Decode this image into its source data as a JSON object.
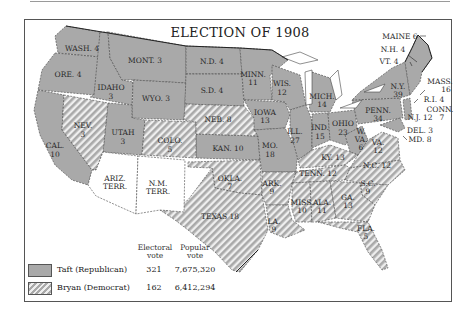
{
  "title": "ELECTION OF 1908",
  "colors": {
    "republican": "#a9a9a9",
    "democrat_hatch_dark": "#a9a9a9",
    "democrat_hatch_light": "#eeeeee",
    "territory": "#ffffff",
    "border": "#444444"
  },
  "legend": {
    "col_electoral": "Electoral",
    "col_electoral_2": "vote",
    "col_popular": "Popular",
    "col_popular_2": "vote",
    "rows": [
      {
        "name": "Taft (Republican)",
        "electoral": "321",
        "popular": "7,675,320",
        "pattern": "solid-gray"
      },
      {
        "name": "Bryan (Democrat)",
        "electoral": "162",
        "popular": "6,412,294",
        "pattern": "hatched"
      }
    ]
  },
  "states": {
    "wash": "WASH. 4",
    "ore": "ORE. 4",
    "cal": "CAL.",
    "cal_n": "10",
    "idaho": "IDAHO",
    "idaho_n": "3",
    "nev": "NEV.",
    "nev_n": "3",
    "mont": "MONT. 3",
    "wyo": "WYO. 3",
    "utah": "UTAH",
    "utah_n": "3",
    "colo": "COLO.",
    "colo_n": "5",
    "ariz": "ARIZ.",
    "ariz_2": "TERR.",
    "nm": "N.M.",
    "nm_2": "TERR.",
    "nd": "N.D. 4",
    "sd": "S.D. 4",
    "neb": "NEB. 8",
    "kan": "KAN. 10",
    "okla": "OKLA.",
    "okla_n": "7",
    "texas": "TEXAS 18",
    "minn": "MINN.",
    "minn_n": "11",
    "iowa": "IOWA",
    "iowa_n": "13",
    "mo": "MO.",
    "mo_n": "18",
    "ark": "ARK.",
    "ark_n": "9",
    "la": "LA.",
    "la_n": "9",
    "wis": "WIS.",
    "wis_n": "12",
    "ill": "ILL.",
    "ill_n": "27",
    "mich": "MICH.",
    "mich_n": "14",
    "ind": "IND.",
    "ind_n": "15",
    "ohio": "OHIO",
    "ohio_n": "23",
    "ky": "KY. 13",
    "tenn": "TENN. 12",
    "miss": "MISS.",
    "miss_n": "10",
    "ala": "ALA.",
    "ala_n": "11",
    "ga": "GA.",
    "ga_n": "13",
    "fla": "FLA.",
    "fla_n": "5",
    "sc": "S.C.",
    "sc_n": "9",
    "nc": "N.C. 12",
    "va": "VA.",
    "va_n": "12",
    "wva": "W.",
    "wva_2": "VA.",
    "wva_n": "6",
    "penn": "PENN.",
    "penn_n": "34",
    "ny": "N.Y.",
    "ny_n": "39",
    "maine": "MAINE 6",
    "nh": "N.H. 4",
    "vt": "VT. 4",
    "mass": "MASS.",
    "mass_n": "16",
    "ri": "R.I. 4",
    "conn": "CONN.",
    "conn_n": "7",
    "nj": "N.J. 12",
    "del": "DEL. 3",
    "md": "MD. 8"
  }
}
